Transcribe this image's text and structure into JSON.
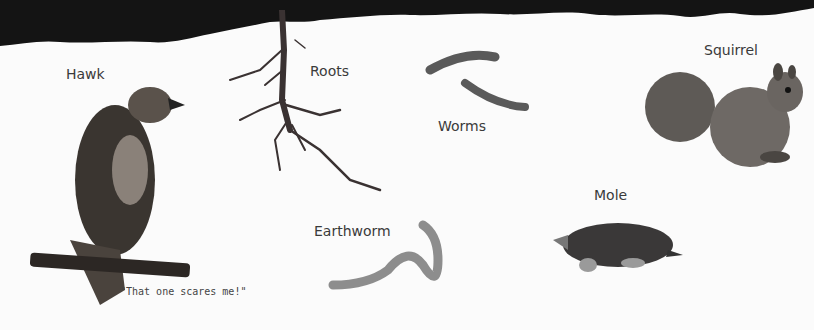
{
  "labels": {
    "hawk": "Hawk",
    "roots": "Roots",
    "worms": "Worms",
    "squirrel": "Squirrel",
    "earthworm": "Earthworm",
    "mole": "Mole"
  },
  "caption": "\"That one scares me!\"",
  "colors": {
    "soil": "#141414",
    "background": "#fbfbfb",
    "label_text": "#3a3a3a"
  }
}
